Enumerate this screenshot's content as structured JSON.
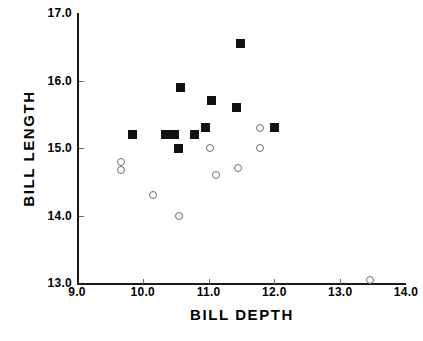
{
  "chart_data": {
    "type": "scatter",
    "title": "",
    "xlabel": "BILL  DEPTH",
    "ylabel": "BILL  LENGTH",
    "xlim": [
      9.0,
      14.0
    ],
    "ylim": [
      13.0,
      17.0
    ],
    "xticks": [
      "9.0",
      "10.0",
      "11.0",
      "12.0",
      "13.0",
      "14.0"
    ],
    "yticks": [
      "13.0",
      "14.0",
      "15.0",
      "16.0",
      "17.0"
    ],
    "xtick_values": [
      9.0,
      10.0,
      11.0,
      12.0,
      13.0,
      14.0
    ],
    "ytick_values": [
      13.0,
      14.0,
      15.0,
      16.0,
      17.0
    ],
    "grid": false,
    "legend": "none",
    "series": [
      {
        "name": "filled-square",
        "marker": "filled-square",
        "color": "#111111",
        "points": [
          {
            "x": 9.85,
            "y": 15.2
          },
          {
            "x": 10.35,
            "y": 15.2
          },
          {
            "x": 10.48,
            "y": 15.2
          },
          {
            "x": 10.55,
            "y": 15.0
          },
          {
            "x": 10.58,
            "y": 15.9
          },
          {
            "x": 10.78,
            "y": 15.2
          },
          {
            "x": 10.95,
            "y": 15.3
          },
          {
            "x": 11.05,
            "y": 15.7
          },
          {
            "x": 11.42,
            "y": 15.6
          },
          {
            "x": 11.48,
            "y": 16.55
          },
          {
            "x": 12.0,
            "y": 15.3
          }
        ]
      },
      {
        "name": "open-circle",
        "marker": "open-circle",
        "color": "#6e6e6e",
        "points": [
          {
            "x": 9.67,
            "y": 14.8
          },
          {
            "x": 9.67,
            "y": 14.68
          },
          {
            "x": 10.15,
            "y": 14.3
          },
          {
            "x": 10.55,
            "y": 14.0
          },
          {
            "x": 11.02,
            "y": 15.0
          },
          {
            "x": 11.12,
            "y": 14.6
          },
          {
            "x": 11.45,
            "y": 14.7
          },
          {
            "x": 11.78,
            "y": 15.3
          },
          {
            "x": 11.78,
            "y": 15.0
          },
          {
            "x": 13.45,
            "y": 13.05
          }
        ]
      }
    ]
  },
  "caption": ""
}
